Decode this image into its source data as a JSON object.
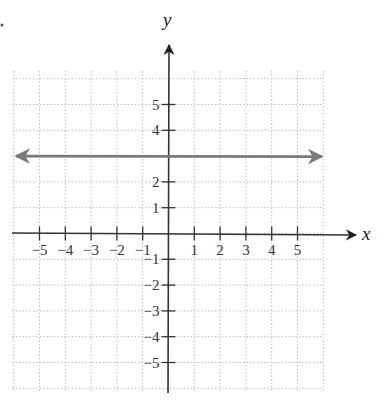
{
  "chart_data": {
    "type": "line",
    "title": "",
    "xlabel": "x",
    "ylabel": "y",
    "xlim": [
      -6,
      6
    ],
    "ylim": [
      -6,
      6
    ],
    "grid": true,
    "grid_style": "dotted",
    "x_ticks": [
      -5,
      -4,
      -3,
      -2,
      -1,
      1,
      2,
      3,
      4,
      5
    ],
    "y_ticks": [
      -5,
      -4,
      -3,
      -2,
      -1,
      1,
      2,
      4,
      5
    ],
    "x_tick_labels": [
      "−5",
      "−4",
      "−3",
      "−2",
      "−1",
      "1",
      "2",
      "3",
      "4",
      "5"
    ],
    "y_tick_labels": [
      "−5",
      "−4",
      "−3",
      "−2",
      "−1",
      "1",
      "2",
      "4",
      "5"
    ],
    "series": [
      {
        "name": "y = 3",
        "kind": "horizontal-line",
        "equation": "y = 3",
        "x": [
          -6,
          6
        ],
        "y": [
          3,
          3
        ],
        "arrows": "both",
        "color": "#7a7a7a"
      }
    ],
    "legend": null
  },
  "colors": {
    "axis": "#333333",
    "line": "#7a7a7a",
    "grid": "#bdbdbd"
  }
}
